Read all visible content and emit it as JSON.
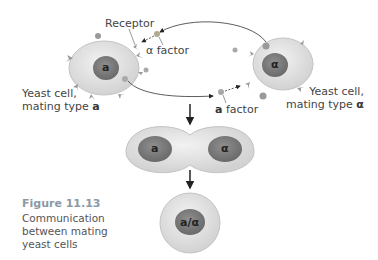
{
  "figure": {
    "number": "Figure 11.13",
    "caption_lines": [
      "Communication",
      "between mating",
      "yeast cells"
    ]
  },
  "labels": {
    "receptor": "Receptor",
    "alpha_factor": "α factor",
    "a_factor_prefix": "a",
    "a_factor_suffix": " factor",
    "cell_a_line1": "Yeast cell,",
    "cell_a_line2_prefix": "mating type ",
    "cell_a_line2_type": "a",
    "cell_alpha_line1": "Yeast cell,",
    "cell_alpha_line2_prefix": "mating type ",
    "cell_alpha_line2_type": "α"
  },
  "nuclei": {
    "cell_a": "a",
    "cell_alpha": "α",
    "fusing_a": "a",
    "fusing_alpha": "α",
    "diploid": "a/α"
  },
  "colors": {
    "cytoplasm": "#e6e6e6",
    "cytoplasm_edge": "#c8c8c8",
    "nucleus": "#8a8a8a",
    "nucleus_dark": "#6e6e6e",
    "receptor": "#9a9a9a",
    "factor": "#a8a8a8",
    "arrow": "#222222",
    "caption_title": "#8a9aa6"
  }
}
